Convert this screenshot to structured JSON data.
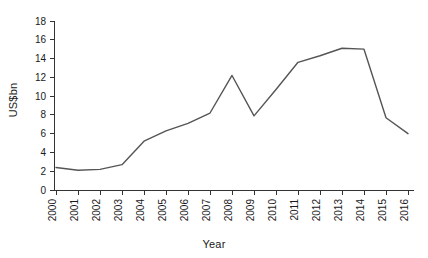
{
  "chart_data": {
    "type": "line",
    "title": "",
    "xlabel": "Year",
    "ylabel": "US$bn",
    "categories": [
      "2000",
      "2001",
      "2002",
      "2003",
      "2004",
      "2005",
      "2006",
      "2007",
      "2008",
      "2009",
      "2010",
      "2011",
      "2012",
      "2013",
      "2014",
      "2015",
      "2016"
    ],
    "values": [
      2.4,
      2.1,
      2.2,
      2.7,
      5.2,
      6.3,
      7.1,
      8.2,
      12.2,
      7.9,
      10.7,
      13.6,
      14.3,
      15.1,
      15.0,
      7.7,
      6.0
    ],
    "series": [
      {
        "name": "US$bn",
        "values": [
          2.4,
          2.1,
          2.2,
          2.7,
          5.2,
          6.3,
          7.1,
          8.2,
          12.2,
          7.9,
          10.7,
          13.6,
          14.3,
          15.1,
          15.0,
          7.7,
          6.0
        ]
      }
    ],
    "ylim": [
      0,
      18
    ],
    "yticks": [
      0,
      2,
      4,
      6,
      8,
      10,
      12,
      14,
      16,
      18
    ],
    "ytick_labels": [
      "0",
      "2",
      "4",
      "6",
      "8",
      "10",
      "12",
      "14",
      "16",
      "18"
    ],
    "xtick_labels": [
      "2000",
      "2001",
      "2002",
      "2003",
      "2004",
      "2005",
      "2006",
      "2007",
      "2008",
      "2009",
      "2010",
      "2011",
      "2012",
      "2013",
      "2014",
      "2015",
      "2016"
    ],
    "grid": false,
    "legend": false,
    "legend_position": "none",
    "line_color": "#555555",
    "axis_color": "#333333",
    "background_color": "#ffffff",
    "xtick_label_rotation": -90
  }
}
